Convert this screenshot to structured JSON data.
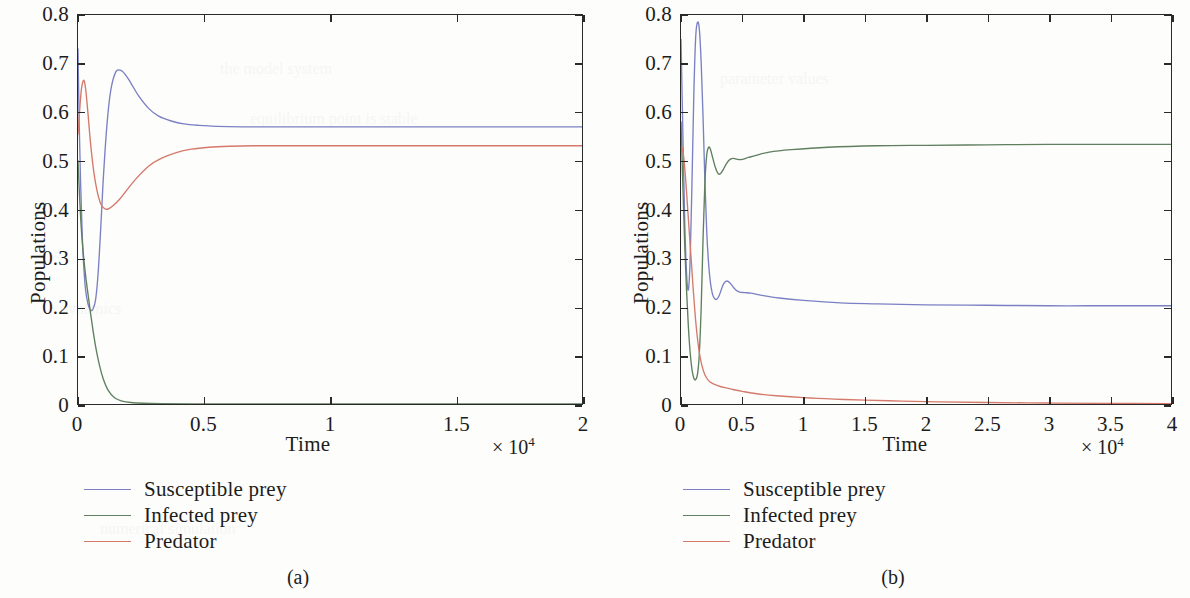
{
  "figure": {
    "panels": [
      {
        "caption": "(a)",
        "axis": {
          "xlabel": "Time",
          "ylabel": "Populations",
          "x_exponent_prefix": "× 10",
          "x_exponent_power": "4",
          "xticks": [
            "0",
            "0.5",
            "1",
            "1.5",
            "2"
          ],
          "xtick_values": [
            0,
            0.5,
            1,
            1.5,
            2
          ],
          "yticks": [
            "0",
            "0.1",
            "0.2",
            "0.3",
            "0.4",
            "0.5",
            "0.6",
            "0.7",
            "0.8"
          ],
          "ytick_values": [
            0,
            0.1,
            0.2,
            0.3,
            0.4,
            0.5,
            0.6,
            0.7,
            0.8
          ],
          "xlim": [
            0,
            2
          ],
          "ylim": [
            0,
            0.8
          ]
        },
        "legend": [
          {
            "label": "Susceptible prey",
            "color": "#7b80c4"
          },
          {
            "label": "Infected prey",
            "color": "#5f7f5f"
          },
          {
            "label": "Predator",
            "color": "#d4796b"
          }
        ]
      },
      {
        "caption": "(b)",
        "axis": {
          "xlabel": "Time",
          "ylabel": "Populations",
          "x_exponent_prefix": "× 10",
          "x_exponent_power": "4",
          "xticks": [
            "0",
            "0.5",
            "1",
            "1.5",
            "2",
            "2.5",
            "3",
            "3.5",
            "4"
          ],
          "xtick_values": [
            0,
            0.5,
            1,
            1.5,
            2,
            2.5,
            3,
            3.5,
            4
          ],
          "yticks": [
            "0",
            "0.1",
            "0.2",
            "0.3",
            "0.4",
            "0.5",
            "0.6",
            "0.7",
            "0.8"
          ],
          "ytick_values": [
            0,
            0.1,
            0.2,
            0.3,
            0.4,
            0.5,
            0.6,
            0.7,
            0.8
          ],
          "xlim": [
            0,
            4
          ],
          "ylim": [
            0,
            0.8
          ]
        },
        "legend": [
          {
            "label": "Susceptible prey",
            "color": "#7b80c4"
          },
          {
            "label": "Infected prey",
            "color": "#5f7f5f"
          },
          {
            "label": "Predator",
            "color": "#d4796b"
          }
        ]
      }
    ]
  },
  "chart_data": [
    {
      "type": "line",
      "title": "(a)",
      "xlabel": "Time",
      "ylabel": "Populations",
      "x_axis_multiplier": "× 10^4",
      "xlim": [
        0,
        2
      ],
      "ylim": [
        0,
        0.8
      ],
      "grid": false,
      "legend_position": "below-left",
      "series": [
        {
          "name": "Susceptible prey",
          "color": "#7b80c4",
          "x": [
            0,
            0.004,
            0.01,
            0.016,
            0.022,
            0.03,
            0.04,
            0.05,
            0.06,
            0.07,
            0.08,
            0.09,
            0.1,
            0.115,
            0.13,
            0.15,
            0.17,
            0.19,
            0.21,
            0.24,
            0.28,
            0.32,
            0.37,
            0.42,
            0.48,
            0.55,
            0.65,
            0.8,
            1.0,
            1.25,
            1.5,
            1.75,
            2.0
          ],
          "y": [
            0.73,
            0.6,
            0.46,
            0.36,
            0.29,
            0.235,
            0.205,
            0.193,
            0.196,
            0.215,
            0.27,
            0.36,
            0.46,
            0.575,
            0.645,
            0.683,
            0.686,
            0.676,
            0.66,
            0.634,
            0.608,
            0.592,
            0.582,
            0.576,
            0.573,
            0.571,
            0.57,
            0.57,
            0.57,
            0.57,
            0.57,
            0.57,
            0.57
          ]
        },
        {
          "name": "Infected prey",
          "color": "#5f7f5f",
          "x": [
            0,
            0.005,
            0.012,
            0.02,
            0.03,
            0.04,
            0.05,
            0.06,
            0.07,
            0.085,
            0.1,
            0.12,
            0.145,
            0.175,
            0.21,
            0.26,
            0.33,
            0.45,
            0.6,
            0.9,
            1.3,
            1.7,
            2.0
          ],
          "y": [
            0.5,
            0.44,
            0.37,
            0.315,
            0.265,
            0.225,
            0.186,
            0.15,
            0.118,
            0.08,
            0.052,
            0.028,
            0.013,
            0.006,
            0.003,
            0.0015,
            0.0008,
            0.0004,
            0.0002,
            0.0001,
            5e-05,
            2e-05,
            0.0
          ]
        },
        {
          "name": "Predator",
          "color": "#d4796b",
          "x": [
            0,
            0.006,
            0.013,
            0.02,
            0.026,
            0.032,
            0.04,
            0.05,
            0.062,
            0.075,
            0.09,
            0.105,
            0.12,
            0.14,
            0.165,
            0.195,
            0.23,
            0.28,
            0.33,
            0.39,
            0.45,
            0.52,
            0.6,
            0.7,
            0.85,
            1.05,
            1.3,
            1.6,
            2.0
          ],
          "y": [
            0.555,
            0.6,
            0.645,
            0.664,
            0.662,
            0.64,
            0.595,
            0.535,
            0.48,
            0.44,
            0.412,
            0.402,
            0.401,
            0.408,
            0.421,
            0.441,
            0.463,
            0.489,
            0.505,
            0.517,
            0.524,
            0.528,
            0.53,
            0.531,
            0.531,
            0.531,
            0.531,
            0.531,
            0.531
          ]
        }
      ]
    },
    {
      "type": "line",
      "title": "(b)",
      "xlabel": "Time",
      "ylabel": "Populations",
      "x_axis_multiplier": "× 10^4",
      "xlim": [
        0,
        4
      ],
      "ylim": [
        0,
        0.8
      ],
      "grid": false,
      "legend_position": "below-left",
      "series": [
        {
          "name": "Susceptible prey",
          "color": "#7b80c4",
          "x": [
            0,
            0.015,
            0.03,
            0.045,
            0.06,
            0.075,
            0.09,
            0.105,
            0.12,
            0.135,
            0.15,
            0.165,
            0.18,
            0.195,
            0.21,
            0.225,
            0.24,
            0.255,
            0.27,
            0.29,
            0.31,
            0.33,
            0.35,
            0.375,
            0.4,
            0.425,
            0.45,
            0.48,
            0.52,
            0.57,
            0.65,
            0.8,
            1.0,
            1.3,
            1.6,
            2.0,
            2.5,
            3.0,
            3.5,
            4.0
          ],
          "y": [
            0.75,
            0.56,
            0.38,
            0.27,
            0.235,
            0.3,
            0.46,
            0.64,
            0.755,
            0.785,
            0.77,
            0.7,
            0.59,
            0.46,
            0.355,
            0.29,
            0.25,
            0.228,
            0.218,
            0.215,
            0.222,
            0.236,
            0.248,
            0.253,
            0.249,
            0.241,
            0.234,
            0.23,
            0.229,
            0.228,
            0.224,
            0.218,
            0.213,
            0.208,
            0.206,
            0.204,
            0.203,
            0.202,
            0.202,
            0.202
          ]
        },
        {
          "name": "Infected prey",
          "color": "#5f7f5f",
          "x": [
            0,
            0.015,
            0.03,
            0.045,
            0.06,
            0.075,
            0.09,
            0.105,
            0.12,
            0.135,
            0.15,
            0.165,
            0.18,
            0.195,
            0.21,
            0.225,
            0.24,
            0.26,
            0.28,
            0.3,
            0.32,
            0.345,
            0.37,
            0.4,
            0.43,
            0.46,
            0.5,
            0.55,
            0.62,
            0.72,
            0.9,
            1.2,
            1.6,
            2.0,
            2.5,
            3.0,
            3.5,
            4.0
          ],
          "y": [
            0.58,
            0.45,
            0.33,
            0.235,
            0.16,
            0.105,
            0.07,
            0.053,
            0.05,
            0.062,
            0.105,
            0.2,
            0.34,
            0.455,
            0.512,
            0.528,
            0.524,
            0.505,
            0.487,
            0.475,
            0.473,
            0.482,
            0.494,
            0.503,
            0.505,
            0.503,
            0.503,
            0.507,
            0.512,
            0.518,
            0.523,
            0.528,
            0.531,
            0.532,
            0.533,
            0.534,
            0.534,
            0.534
          ]
        },
        {
          "name": "Predator",
          "color": "#d4796b",
          "x": [
            0,
            0.012,
            0.025,
            0.04,
            0.055,
            0.07,
            0.085,
            0.1,
            0.115,
            0.13,
            0.15,
            0.17,
            0.195,
            0.225,
            0.26,
            0.3,
            0.35,
            0.42,
            0.5,
            0.62,
            0.78,
            1.0,
            1.25,
            1.5,
            1.8,
            2.1,
            2.5,
            3.0,
            3.5,
            4.0
          ],
          "y": [
            0.53,
            0.525,
            0.5,
            0.455,
            0.4,
            0.345,
            0.29,
            0.235,
            0.185,
            0.145,
            0.105,
            0.08,
            0.06,
            0.048,
            0.042,
            0.038,
            0.034,
            0.03,
            0.026,
            0.021,
            0.017,
            0.013,
            0.01,
            0.008,
            0.006,
            0.0045,
            0.003,
            0.002,
            0.0012,
            0.0008
          ]
        }
      ]
    }
  ]
}
